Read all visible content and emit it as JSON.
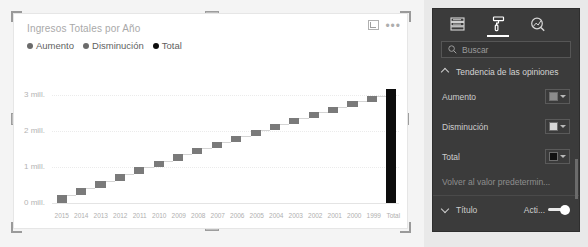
{
  "visual": {
    "title": "Ingresos Totales por Año",
    "focus_icon": "focus-mode-icon",
    "more_options": "•••",
    "legend": [
      {
        "label": "Aumento",
        "color": "#6b6b6b"
      },
      {
        "label": "Disminución",
        "color": "#6b6b6b"
      },
      {
        "label": "Total",
        "color": "#0d0d0d"
      }
    ]
  },
  "chart_data": {
    "type": "bar",
    "subtype": "waterfall",
    "title": "Ingresos Totales por Año",
    "xlabel": "",
    "ylabel": "",
    "ylim": [
      0,
      3400000
    ],
    "grid": true,
    "legend_position": "top-left",
    "ytick_labels": [
      "3 mill.",
      "2 mill.",
      "1 mill.",
      "0 mill."
    ],
    "ytick_values": [
      3000000,
      2000000,
      1000000,
      0
    ],
    "categories": [
      "2015",
      "2014",
      "2013",
      "2012",
      "2011",
      "2010",
      "2009",
      "2008",
      "2007",
      "2006",
      "2005",
      "2004",
      "2003",
      "2002",
      "2001",
      "2000",
      "1999",
      "Total"
    ],
    "series": [
      {
        "name": "Aumento",
        "values": [
          220000,
          205000,
          195000,
          190000,
          185000,
          180000,
          178000,
          175000,
          172000,
          170000,
          168000,
          165000,
          162000,
          160000,
          158000,
          155000,
          152000,
          null
        ]
      },
      {
        "name": "Total",
        "values": [
          null,
          null,
          null,
          null,
          null,
          null,
          null,
          null,
          null,
          null,
          null,
          null,
          null,
          null,
          null,
          null,
          null,
          3180000
        ]
      }
    ],
    "cumulative": [
      220000,
      425000,
      620000,
      810000,
      995000,
      1175000,
      1353000,
      1528000,
      1700000,
      1870000,
      2038000,
      2203000,
      2365000,
      2525000,
      2683000,
      2838000,
      2990000,
      3180000
    ]
  },
  "pane": {
    "tabs": [
      {
        "name": "fields-tab",
        "icon": "fields-icon",
        "active": false
      },
      {
        "name": "format-tab",
        "icon": "paint-roller-icon",
        "active": true
      },
      {
        "name": "analytics-tab",
        "icon": "analytics-magnifier-icon",
        "active": false
      }
    ],
    "search": {
      "placeholder": "Buscar",
      "value": "",
      "icon": "search-icon"
    },
    "section": {
      "label": "Tendencia de las opiniones",
      "expanded": true
    },
    "rows": [
      {
        "label": "Aumento",
        "swatch": "#8c8c8c"
      },
      {
        "label": "Disminución",
        "swatch": "#d6d6d6"
      },
      {
        "label": "Total",
        "swatch": "#111111"
      }
    ],
    "reset_label": "Volver al valor predetermin...",
    "title_section": {
      "label": "Título",
      "toggle_label": "Acti...",
      "toggle_on": true
    }
  }
}
